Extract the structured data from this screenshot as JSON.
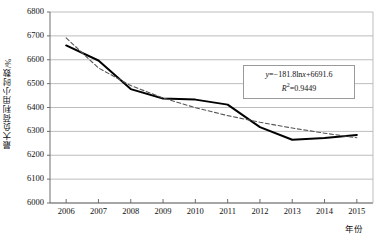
{
  "chart_data": {
    "type": "line",
    "title": "",
    "xlabel": "年份",
    "ylabel": "最大负荷利用小时数/%",
    "x": [
      2006,
      2007,
      2008,
      2009,
      2010,
      2011,
      2012,
      2013,
      2014,
      2015
    ],
    "categories": [
      "2006",
      "2007",
      "2008",
      "2009",
      "2010",
      "2011",
      "2012",
      "2013",
      "2014",
      "2015"
    ],
    "ylim": [
      6000,
      6800
    ],
    "yticks": [
      6000,
      6100,
      6200,
      6300,
      6400,
      6500,
      6600,
      6700,
      6800
    ],
    "ytick_labels": [
      "6000",
      "6100",
      "6200",
      "6300",
      "6400",
      "6500",
      "6600",
      "6700",
      "6800"
    ],
    "grid": true,
    "legend": "none",
    "series": [
      {
        "name": "最大负荷利用小时数",
        "style": "solid",
        "color": "#000000",
        "values": [
          6660,
          6597,
          6477,
          6438,
          6433,
          6412,
          6318,
          6265,
          6272,
          6285
        ]
      },
      {
        "name": "对数趋势线",
        "style": "dashed",
        "color": "#555555",
        "values": [
          6691.6,
          6565.6,
          6491.9,
          6439.7,
          6399.2,
          6366.1,
          6338.2,
          6313.9,
          6292.4,
          6273.2
        ]
      }
    ],
    "annotations": [
      {
        "name": "trendline-equation",
        "equation": "y=−181.8lnx+6691.6",
        "r_squared": "R2=0.9449",
        "equation_y": "y",
        "equation_rest": "=−181.8ln",
        "equation_x": "x",
        "equation_tail": "+6691.6",
        "r_label": "R",
        "r_exp": "2",
        "r_value": "=0.9449"
      }
    ]
  },
  "axes": {
    "y_title": "最大负荷利用小时数/%",
    "x_title": "年份"
  },
  "colors": {
    "grid": "#b5b5b5",
    "axis": "#6e6e6e",
    "series_solid": "#000000",
    "series_dashed": "#555555",
    "box_border": "#9a9a9a",
    "background": "#ffffff"
  }
}
